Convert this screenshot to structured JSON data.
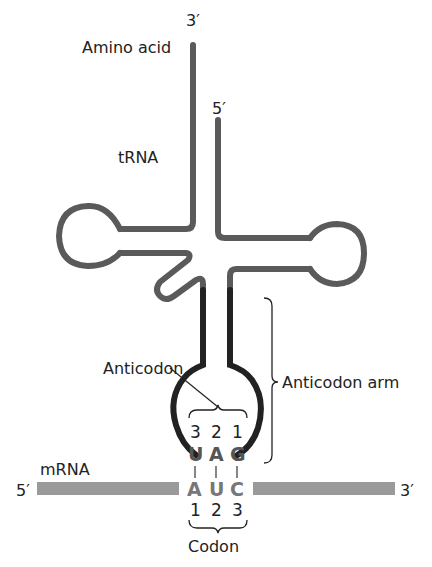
{
  "labels": {
    "amino_acid": "Amino acid",
    "trna": "tRNA",
    "three_prime_top": "3′",
    "five_prime_top": "5′",
    "anticodon": "Anticodon",
    "anticodon_arm": "Anticodon arm",
    "mrna": "mRNA",
    "mrna_five_prime": "5′",
    "mrna_three_prime": "3′",
    "codon": "Codon"
  },
  "anticodon_bases": [
    {
      "letter": "U",
      "position": "3"
    },
    {
      "letter": "A",
      "position": "2"
    },
    {
      "letter": "G",
      "position": "1"
    }
  ],
  "codon_bases": [
    {
      "letter": "A",
      "position": "1"
    },
    {
      "letter": "U",
      "position": "2"
    },
    {
      "letter": "C",
      "position": "3"
    }
  ],
  "colors": {
    "trna_strand": "#5a5a5a",
    "anticodon_arm": "#222222",
    "mrna_bar": "#9a9a9a",
    "anticodon_letters": "#555555",
    "codon_letters": "#777777"
  }
}
